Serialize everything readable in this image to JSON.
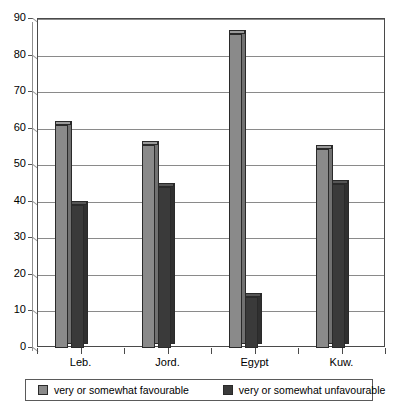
{
  "chart_data": {
    "type": "bar",
    "title": "",
    "subtitle": "",
    "xlabel": "",
    "ylabel": "",
    "categories": [
      "Leb.",
      "Jord.",
      "Egypt",
      "Kuw."
    ],
    "series": [
      {
        "name": "very or somewhat favourable",
        "color": "#8a8a8a",
        "values": [
          61,
          55.5,
          86,
          54.5
        ]
      },
      {
        "name": "very or somewhat unfavourable",
        "color": "#3a3a3a",
        "values": [
          39,
          44,
          14,
          45
        ]
      }
    ],
    "ylim": [
      0,
      90
    ],
    "ytick_labels": [
      "0",
      "10",
      "20",
      "30",
      "40",
      "50",
      "60",
      "70",
      "80",
      "90"
    ],
    "ytick_values": [
      0,
      10,
      20,
      30,
      40,
      50,
      60,
      70,
      80,
      90
    ],
    "grid": true,
    "grid_axis": "y",
    "legend_position": "bottom",
    "style": "3d-column"
  },
  "legend": {
    "entries": [
      {
        "label": "very or somewhat favourable",
        "swatch": "#8a8a8a"
      },
      {
        "label": "very or somewhat unfavourable",
        "swatch": "#3a3a3a"
      }
    ]
  }
}
